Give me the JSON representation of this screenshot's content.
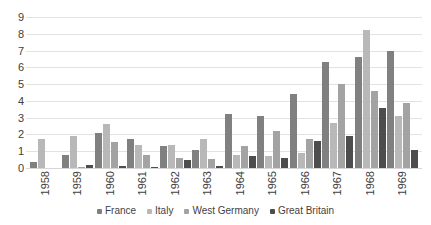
{
  "chart_data": {
    "type": "bar",
    "title": "",
    "xlabel": "",
    "ylabel": "",
    "ylim": [
      0,
      9
    ],
    "yticks": [
      0,
      1,
      2,
      3,
      4,
      5,
      6,
      7,
      8,
      9
    ],
    "grid": true,
    "legend_position": "bottom",
    "categories": [
      "1958",
      "1959",
      "1960",
      "1961",
      "1962",
      "1963",
      "1964",
      "1965",
      "1966",
      "1967",
      "1968",
      "1969"
    ],
    "series": [
      {
        "name": "France",
        "color": "#808080",
        "values": [
          0.35,
          0.8,
          2.1,
          1.7,
          1.3,
          1.05,
          3.2,
          3.1,
          4.4,
          6.3,
          6.6,
          7.0
        ]
      },
      {
        "name": "Italy",
        "color": "#b8b8b8",
        "values": [
          1.7,
          1.9,
          2.6,
          1.35,
          1.4,
          1.75,
          0.8,
          0.7,
          0.9,
          2.7,
          8.2,
          3.1
        ]
      },
      {
        "name": "West Germany",
        "color": "#a3a3a3",
        "values": [
          0,
          0.05,
          1.55,
          0.75,
          0.6,
          0.55,
          1.3,
          2.2,
          1.7,
          5.0,
          4.6,
          3.9
        ]
      },
      {
        "name": "Great Britain",
        "color": "#4d4d4d",
        "values": [
          0,
          0.2,
          0.1,
          0.05,
          0.45,
          0.1,
          0.7,
          0.6,
          1.6,
          1.9,
          3.6,
          1.1
        ]
      }
    ]
  },
  "colors": {
    "gridline": "#e2e2e2",
    "tick_text": "#404040",
    "legend_text": "#3f3f3f",
    "background": "#ffffff"
  }
}
